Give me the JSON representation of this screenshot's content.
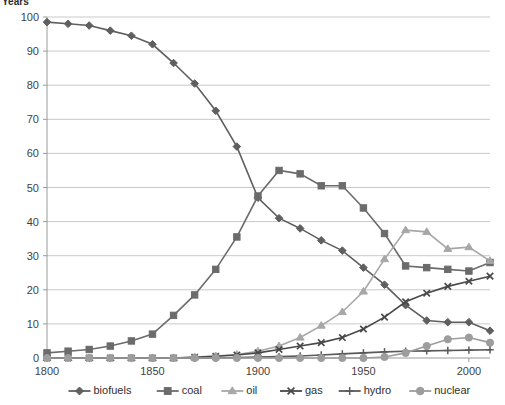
{
  "axis_title": "Years",
  "chart_data": {
    "type": "line",
    "title": "",
    "subtitle": "",
    "xlabel": "Years",
    "ylabel": "",
    "xlim": [
      1800,
      2010
    ],
    "ylim": [
      0,
      100
    ],
    "ytick_step": 10,
    "grid": true,
    "legend_position": "bottom",
    "xticks": [
      "1800",
      "1850",
      "1900",
      "1950",
      "2000"
    ],
    "xtick_values": [
      1800,
      1850,
      1900,
      1950,
      2000
    ],
    "yticks": [
      "0",
      "10",
      "20",
      "30",
      "40",
      "50",
      "60",
      "70",
      "80",
      "90",
      "100"
    ],
    "ytick_values": [
      0,
      10,
      20,
      30,
      40,
      50,
      60,
      70,
      80,
      90,
      100
    ],
    "x": [
      1800,
      1810,
      1820,
      1830,
      1840,
      1850,
      1860,
      1870,
      1880,
      1890,
      1900,
      1910,
      1920,
      1930,
      1940,
      1950,
      1960,
      1970,
      1980,
      1990,
      2000,
      2010
    ],
    "series": [
      {
        "name": "biofuels",
        "marker": "diamond",
        "color": "#5f5f5f",
        "values": [
          98.5,
          98.0,
          97.5,
          96.0,
          94.5,
          92.0,
          86.5,
          80.5,
          72.5,
          62.0,
          47.0,
          41.0,
          38.0,
          34.5,
          31.5,
          26.5,
          21.5,
          15.5,
          11.0,
          10.5,
          10.5,
          8.0
        ]
      },
      {
        "name": "coal",
        "marker": "square",
        "color": "#6b6b6b",
        "values": [
          1.5,
          2.0,
          2.5,
          3.5,
          5.0,
          7.0,
          12.5,
          18.5,
          26.0,
          35.5,
          47.5,
          55.0,
          54.0,
          50.5,
          50.5,
          44.0,
          36.5,
          27.0,
          26.5,
          26.0,
          25.5,
          28.0
        ]
      },
      {
        "name": "oil",
        "marker": "triangle",
        "color": "#a7a7a7",
        "values": [
          0,
          0,
          0,
          0,
          0,
          0,
          0,
          0.3,
          0.6,
          1.0,
          2.0,
          3.5,
          6.0,
          9.5,
          13.5,
          19.5,
          29.0,
          37.5,
          37.0,
          32.0,
          32.5,
          28.5
        ]
      },
      {
        "name": "gas",
        "marker": "x",
        "color": "#494949",
        "values": [
          0,
          0,
          0,
          0,
          0,
          0,
          0,
          0.2,
          0.5,
          0.9,
          1.5,
          2.5,
          3.5,
          4.5,
          6.0,
          8.5,
          12.0,
          16.5,
          19.0,
          21.0,
          22.5,
          24.0
        ]
      },
      {
        "name": "hydro",
        "marker": "plus",
        "color": "#5a5a5a",
        "values": [
          0,
          0,
          0,
          0,
          0,
          0,
          0,
          0,
          0,
          0.1,
          0.3,
          0.4,
          0.6,
          0.9,
          1.2,
          1.5,
          1.8,
          2.0,
          2.1,
          2.2,
          2.3,
          2.4
        ]
      },
      {
        "name": "nuclear",
        "marker": "circle",
        "color": "#9d9d9d",
        "values": [
          0,
          0,
          0,
          0,
          0,
          0,
          0,
          0,
          0,
          0,
          0,
          0,
          0,
          0,
          0,
          0,
          0.3,
          1.5,
          3.5,
          5.5,
          6.0,
          4.5
        ]
      }
    ]
  }
}
